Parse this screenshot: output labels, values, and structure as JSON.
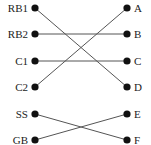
{
  "diagram": {
    "type": "bipartite-matching",
    "left_nodes": [
      {
        "id": "RB1",
        "label": "RB1",
        "y": 8
      },
      {
        "id": "RB2",
        "label": "RB2",
        "y": 34
      },
      {
        "id": "C1",
        "label": "C1",
        "y": 61
      },
      {
        "id": "C2",
        "label": "C2",
        "y": 87
      },
      {
        "id": "SS",
        "label": "SS",
        "y": 114
      },
      {
        "id": "GB",
        "label": "GB",
        "y": 140
      }
    ],
    "right_nodes": [
      {
        "id": "A",
        "label": "A",
        "y": 8
      },
      {
        "id": "B",
        "label": "B",
        "y": 34
      },
      {
        "id": "C",
        "label": "C",
        "y": 61
      },
      {
        "id": "D",
        "label": "D",
        "y": 87
      },
      {
        "id": "E",
        "label": "E",
        "y": 114
      },
      {
        "id": "F",
        "label": "F",
        "y": 140
      }
    ],
    "edges": [
      {
        "from": "RB1",
        "to": "D"
      },
      {
        "from": "RB2",
        "to": "B"
      },
      {
        "from": "C1",
        "to": "C"
      },
      {
        "from": "C2",
        "to": "A"
      },
      {
        "from": "SS",
        "to": "F"
      },
      {
        "from": "GB",
        "to": "E"
      }
    ],
    "colors": {
      "dot": "#111111",
      "edge": "#555555",
      "text": "#222222"
    }
  }
}
